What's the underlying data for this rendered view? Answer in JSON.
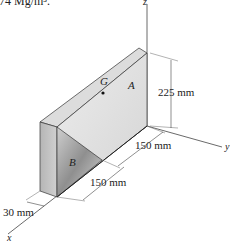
{
  "header_text": "8.74 Mg/m³.",
  "axes": {
    "x": "x",
    "y": "y",
    "z": "z"
  },
  "labels": {
    "part_a": "A",
    "part_b": "B",
    "centroid": "G"
  },
  "dimensions": {
    "height": "225 mm",
    "depth_a": "150 mm",
    "depth_b": "150 mm",
    "thickness": "30 mm"
  },
  "colors": {
    "line": "#333333",
    "face_top": "#d9d9d9",
    "face_front": "#e6e6e6",
    "face_side": "#bdbdbd",
    "face_b": "#a8a8a8"
  }
}
